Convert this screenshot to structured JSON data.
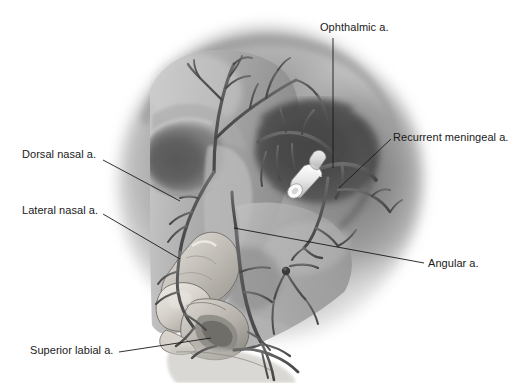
{
  "figure": {
    "view": "Lateral oblique view of the facial skeleton and nose",
    "style": "grayscale medical illustration",
    "background_color": "#ffffff",
    "ink_color": "#1a1a1a",
    "width": 528,
    "height": 383
  },
  "labels": [
    {
      "id": "ophthalmic",
      "text": "Ophthalmic a.",
      "text_x": 320,
      "text_y": 21,
      "anchor": "left",
      "leader": {
        "x1": 333,
        "y1": 38,
        "x2": 333,
        "y2": 168
      }
    },
    {
      "id": "recurrent-meningeal",
      "text": "Recurrent meningeal a.",
      "text_x": 393,
      "text_y": 131,
      "anchor": "left",
      "leader": {
        "x1": 391,
        "y1": 139,
        "x2": 339,
        "y2": 188
      }
    },
    {
      "id": "dorsal-nasal",
      "text": "Dorsal nasal a.",
      "text_x": 22,
      "text_y": 148,
      "anchor": "left",
      "leader": {
        "x1": 103,
        "y1": 160,
        "x2": 180,
        "y2": 201
      }
    },
    {
      "id": "lateral-nasal",
      "text": "Lateral nasal a.",
      "text_x": 22,
      "text_y": 204,
      "anchor": "left",
      "leader": {
        "x1": 103,
        "y1": 214,
        "x2": 180,
        "y2": 259
      }
    },
    {
      "id": "angular",
      "text": "Angular a.",
      "text_x": 428,
      "text_y": 257,
      "anchor": "left",
      "leader": {
        "x1": 424,
        "y1": 263,
        "x2": 234,
        "y2": 228
      }
    },
    {
      "id": "superior-labial",
      "text": "Superior labial a.",
      "text_x": 30,
      "text_y": 344,
      "anchor": "left",
      "leader": {
        "x1": 119,
        "y1": 352,
        "x2": 211,
        "y2": 338
      }
    }
  ],
  "anatomy": {
    "structures": [
      "skull lateral wall",
      "orbital cavity",
      "nasal dorsum",
      "nasal ala",
      "upper lip",
      "zygomatic arch region",
      "cut arterial stump"
    ],
    "vessels": [
      "ophthalmic artery",
      "recurrent meningeal artery",
      "dorsal nasal artery",
      "lateral nasal artery",
      "angular artery",
      "superior labial artery",
      "supratrochlear branches",
      "supraorbital branches"
    ]
  }
}
